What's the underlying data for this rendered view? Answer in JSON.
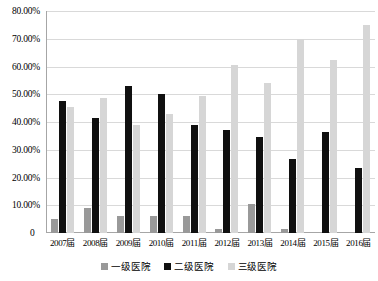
{
  "chart_data": {
    "type": "bar",
    "title": "",
    "subtitle": "",
    "xlabel": "",
    "ylabel": "",
    "ylim": [
      0,
      80
    ],
    "ytick_labels": [
      "80.00%",
      "70.00%",
      "60.00%",
      "50.00%",
      "40.00%",
      "30.00%",
      "20.00%",
      "10.00%"
    ],
    "ytick_values": [
      80,
      70,
      60,
      50,
      40,
      30,
      20,
      10
    ],
    "zero_label": "0",
    "grid": true,
    "legend_position": "bottom",
    "categories": [
      "2007届",
      "2008届",
      "2009届",
      "2010届",
      "2011届",
      "2012届",
      "2013届",
      "2014届",
      "2015届",
      "2016届"
    ],
    "series": [
      {
        "name": "一级医院",
        "color": "#999999",
        "values": [
          5.0,
          9.0,
          6.0,
          6.0,
          6.0,
          1.5,
          10.5,
          1.5,
          0.0,
          0.0
        ]
      },
      {
        "name": "二级医院",
        "color": "#101010",
        "values": [
          47.5,
          41.5,
          53.0,
          50.0,
          39.0,
          37.0,
          34.5,
          26.5,
          36.5,
          23.5
        ]
      },
      {
        "name": "三级医院",
        "color": "#d6d6d6",
        "values": [
          45.5,
          48.5,
          39.0,
          43.0,
          49.5,
          60.5,
          54.0,
          70.0,
          62.5,
          75.0
        ]
      }
    ]
  }
}
